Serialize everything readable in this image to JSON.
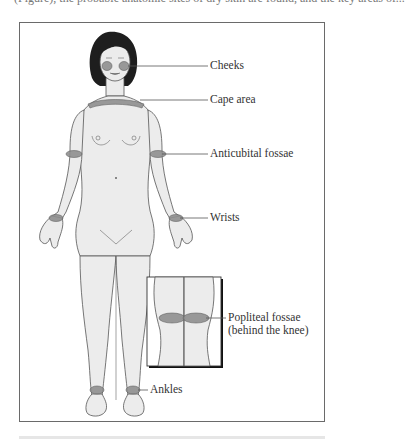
{
  "page": {
    "top_text": "(Figure), the probable anatomic sites of dry skin are found, and the key areas of..."
  },
  "figure": {
    "labels": {
      "cheeks": "Cheeks",
      "cape_area": "Cape area",
      "anticubital_fossae": "Anticubital fossae",
      "wrists": "Wrists",
      "popliteal_line1": "Popliteal fossae",
      "popliteal_line2": "(behind the knee)",
      "ankles": "Ankles"
    },
    "colors": {
      "body_fill": "#ececec",
      "outline": "#555555",
      "hair": "#1e1e1e",
      "band": "#8a8a8a",
      "leader": "#555555"
    }
  }
}
